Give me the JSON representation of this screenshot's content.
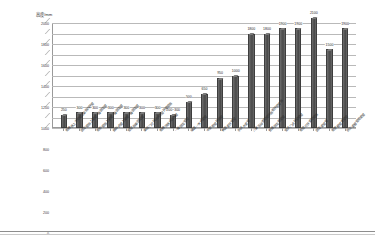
{
  "chart_data": {
    "type": "bar",
    "title": "",
    "subtitle": "",
    "xlabel": "",
    "ylabel": "高度/mm",
    "ylim": [
      0,
      2000
    ],
    "ytick_step": 200,
    "yticks": [
      "0",
      "200",
      "400",
      "600",
      "800",
      "1000",
      "1200",
      "1400",
      "1600",
      "1800",
      "2000"
    ],
    "grid": true,
    "legend": "none",
    "bar_color": "#545454",
    "categories": [
      "带槽板上方带窗口单扇内开窗",
      "固定窗扇上部窗一般固定窗",
      "带形窗扇上部窗一般固定窗",
      "自由式窗上部窗一般固定窗",
      "窗窗扇单固定窗",
      "单扇门可开闭式大窗开窗窗扇",
      "带槽顶板式出入窗",
      "一般固定窗窗",
      "墙面一字式宽窗",
      "中央带窗开扇窗",
      "侧面宽开窗窗",
      "杂式大宽窗",
      "儿童活动室带窗开扇带开窗窗扇",
      "普通固定带宽窗",
      "窗式门式开窗窗窗",
      "带窗可开宽带窗扇",
      "固定宽窗窗",
      "带室屋窗宽窗窗",
      "防火宽屋窗带宽窗"
    ],
    "values": [
      250,
      300,
      300,
      300,
      300,
      300,
      300,
      250,
      500,
      650,
      950,
      1000,
      1800,
      1800,
      1900,
      1900,
      2100,
      1500,
      1900
    ],
    "value_labels": [
      "250",
      "300",
      "300",
      "300",
      "300",
      "300",
      "300",
      "200~300",
      "500",
      "650",
      "950",
      "1000",
      "1800",
      "1800",
      "1900",
      "1900",
      "2100",
      "1500",
      "1900"
    ]
  }
}
